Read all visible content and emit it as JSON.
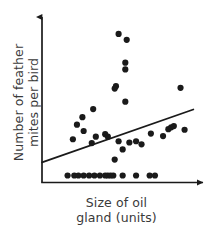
{
  "figure": {
    "background_color": "#ffffff",
    "ink_color": "#1a1a1a",
    "label_color": "#3a3a3a"
  },
  "axes": {
    "x_label_line1": "Size of oil",
    "x_label_line2": "gland (units)",
    "y_label_line1": "Number of feather",
    "y_label_line2": "mites per bird",
    "x_arrow": "arrow-right",
    "y_arrow": "arrow-up",
    "ticks_shown": false,
    "tick_labels": []
  },
  "chart_data": {
    "type": "scatter",
    "title": "",
    "xlabel": "Size of oil gland (units)",
    "ylabel": "Number of feather mites per bird",
    "xlim": [
      0,
      100
    ],
    "ylim": [
      0,
      100
    ],
    "grid": false,
    "legend": "none",
    "marker": {
      "shape": "circle",
      "color": "#1a1a1a",
      "radius_px": 3.1
    },
    "points": [
      {
        "x": 49.1,
        "y": 92.2
      },
      {
        "x": 54.3,
        "y": 88.4
      },
      {
        "x": 53.4,
        "y": 73.5
      },
      {
        "x": 53.4,
        "y": 69.1
      },
      {
        "x": 47.4,
        "y": 58.2
      },
      {
        "x": 46.6,
        "y": 56.6
      },
      {
        "x": 88.8,
        "y": 57.1
      },
      {
        "x": 53.4,
        "y": 48.1
      },
      {
        "x": 32.8,
        "y": 43.3
      },
      {
        "x": 25.9,
        "y": 38.0
      },
      {
        "x": 22.4,
        "y": 33.1
      },
      {
        "x": 26.7,
        "y": 29.0
      },
      {
        "x": 19.8,
        "y": 23.6
      },
      {
        "x": 34.5,
        "y": 25.3
      },
      {
        "x": 40.5,
        "y": 26.9
      },
      {
        "x": 42.2,
        "y": 25.3
      },
      {
        "x": 31.9,
        "y": 21.1
      },
      {
        "x": 49.1,
        "y": 22.3
      },
      {
        "x": 56.0,
        "y": 21.5
      },
      {
        "x": 60.3,
        "y": 22.3
      },
      {
        "x": 69.8,
        "y": 27.3
      },
      {
        "x": 77.6,
        "y": 25.7
      },
      {
        "x": 81.0,
        "y": 30.2
      },
      {
        "x": 82.8,
        "y": 31.4
      },
      {
        "x": 84.5,
        "y": 32.2
      },
      {
        "x": 91.4,
        "y": 29.8
      },
      {
        "x": 51.7,
        "y": 17.0
      },
      {
        "x": 63.8,
        "y": 20.3
      },
      {
        "x": 46.6,
        "y": 10.4
      },
      {
        "x": 16.4,
        "y": 0.0
      },
      {
        "x": 20.7,
        "y": 0.0
      },
      {
        "x": 23.3,
        "y": 0.0
      },
      {
        "x": 26.7,
        "y": 0.0
      },
      {
        "x": 30.2,
        "y": 0.0
      },
      {
        "x": 33.6,
        "y": 0.0
      },
      {
        "x": 37.1,
        "y": 0.0
      },
      {
        "x": 40.5,
        "y": 0.0
      },
      {
        "x": 42.2,
        "y": 0.0
      },
      {
        "x": 44.0,
        "y": 0.0
      },
      {
        "x": 45.7,
        "y": 0.0
      },
      {
        "x": 51.7,
        "y": 0.0
      },
      {
        "x": 60.3,
        "y": 0.0
      },
      {
        "x": 69.0,
        "y": 0.0
      },
      {
        "x": 72.4,
        "y": 0.0
      }
    ],
    "trend_line": {
      "type": "linear-fit",
      "x_start": 0.0,
      "y_start": 8.6,
      "x_end": 97.0,
      "y_end": 43.0,
      "color": "#1a1a1a",
      "width_px": 1.8
    }
  }
}
